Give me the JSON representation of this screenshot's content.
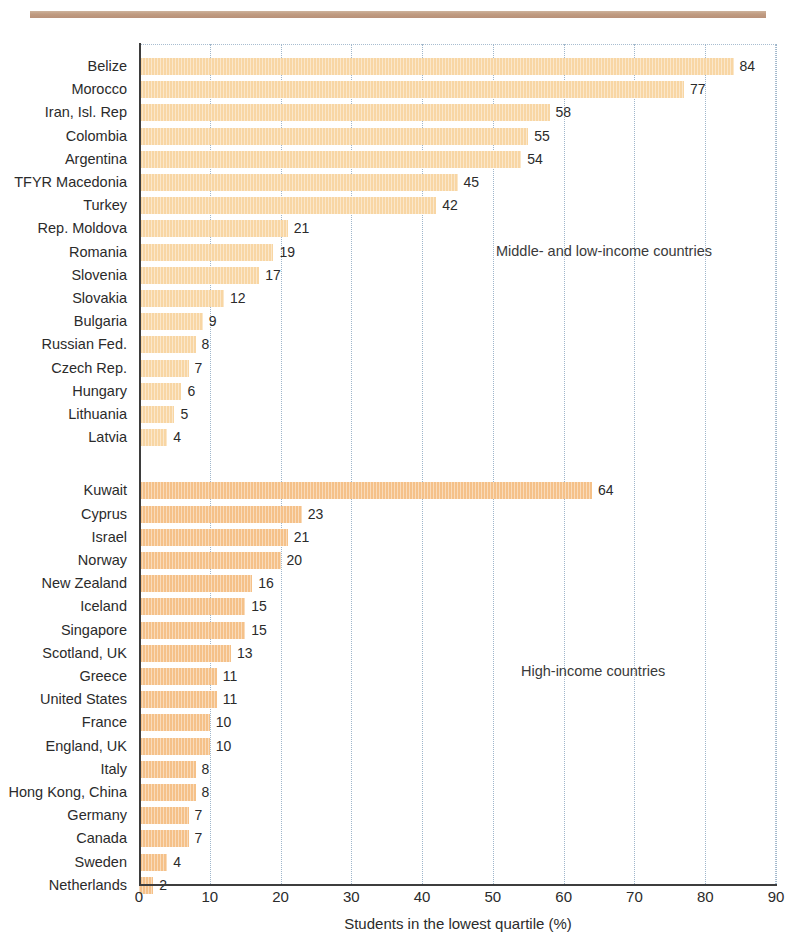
{
  "figure": {
    "divider_color": "#bd9680",
    "clipped_title": "",
    "bar_color_group_a": "#f8d6a4",
    "bar_color_group_b": "#f5c189",
    "axis_color": "#3d3d3d",
    "gridline_color": "#9fb6cb"
  },
  "annotations": {
    "group_a": "Middle- and low-income countries",
    "group_b": "High-income countries"
  },
  "axis": {
    "xlabel": "Students in the lowest quartile (%)",
    "xticks": [
      "0",
      "10",
      "20",
      "30",
      "40",
      "50",
      "60",
      "70",
      "80",
      "90"
    ]
  },
  "chart_data": {
    "type": "bar",
    "orientation": "horizontal",
    "title": "Students in the lowest quartile (%)",
    "xlabel": "Students in the lowest quartile (%)",
    "ylabel": "",
    "xlim": [
      0,
      90
    ],
    "xticks": [
      0,
      10,
      20,
      30,
      40,
      50,
      60,
      70,
      80,
      90
    ],
    "grid": "vertical dotted gridlines at every 10 units",
    "legend": "none (in-plot text annotations identify the two groups)",
    "annotations": [
      "Middle- and low-income countries",
      "High-income countries"
    ],
    "groups": [
      {
        "name": "Middle- and low-income countries",
        "color": "#f8d6a4",
        "categories": [
          "Belize",
          "Morocco",
          "Iran, Isl. Rep",
          "Colombia",
          "Argentina",
          "TFYR Macedonia",
          "Turkey",
          "Rep. Moldova",
          "Romania",
          "Slovenia",
          "Slovakia",
          "Bulgaria",
          "Russian Fed.",
          "Czech Rep.",
          "Hungary",
          "Lithuania",
          "Latvia"
        ],
        "values": [
          84,
          77,
          58,
          55,
          54,
          45,
          42,
          21,
          19,
          17,
          12,
          9,
          8,
          7,
          6,
          5,
          4
        ]
      },
      {
        "name": "High-income countries",
        "color": "#f5c189",
        "categories": [
          "Kuwait",
          "Cyprus",
          "Israel",
          "Norway",
          "New Zealand",
          "Iceland",
          "Singapore",
          "Scotland, UK",
          "Greece",
          "United States",
          "France",
          "England, UK",
          "Italy",
          "Hong Kong, China",
          "Germany",
          "Canada",
          "Sweden",
          "Netherlands"
        ],
        "values": [
          64,
          23,
          21,
          20,
          16,
          15,
          15,
          13,
          11,
          11,
          10,
          10,
          8,
          8,
          7,
          7,
          4,
          2
        ]
      }
    ]
  }
}
